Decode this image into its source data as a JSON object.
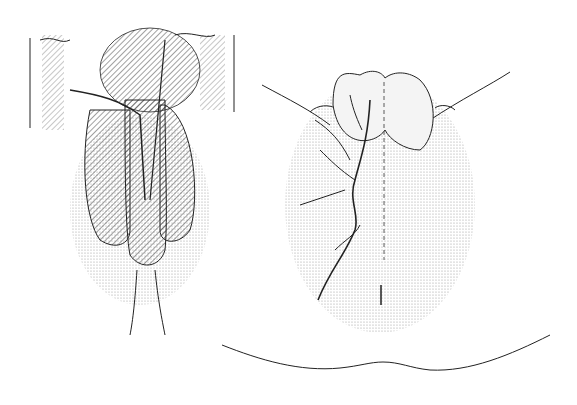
{
  "figure": {
    "panels": [
      {
        "id": "left",
        "description": "anatomical illustration, anterior view with vessels"
      },
      {
        "id": "right",
        "description": "anatomical illustration, perineal view with branching vessels"
      }
    ],
    "colors": {
      "ink": "#222222",
      "stipple": "#bdbdbd",
      "background": "#ffffff"
    }
  }
}
